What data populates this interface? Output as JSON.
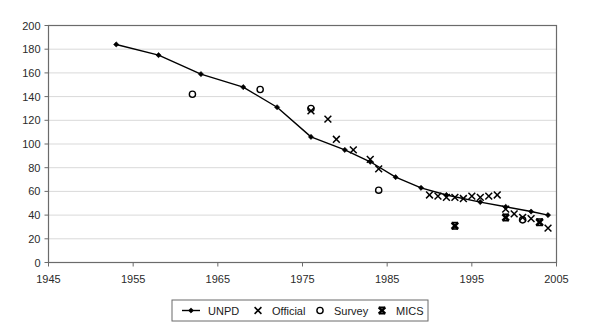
{
  "chart_data": {
    "type": "scatter",
    "title": "",
    "subtitle": "",
    "xlabel": "",
    "ylabel": "",
    "xlim": [
      1945,
      2005
    ],
    "ylim": [
      0,
      200
    ],
    "xticks": [
      1945,
      1955,
      1965,
      1975,
      1985,
      1995,
      2005
    ],
    "yticks": [
      0,
      20,
      40,
      60,
      80,
      100,
      120,
      140,
      160,
      180,
      200
    ],
    "grid": "horizontal",
    "legend_position": "bottom",
    "series": [
      {
        "name": "UNPD",
        "marker": "line-diamond",
        "type": "line",
        "points": [
          [
            1953,
            184
          ],
          [
            1958,
            175
          ],
          [
            1963,
            159
          ],
          [
            1968,
            148
          ],
          [
            1972,
            131
          ],
          [
            1976,
            106
          ],
          [
            1980,
            95
          ],
          [
            1983,
            85
          ],
          [
            1986,
            72
          ],
          [
            1989,
            63
          ],
          [
            1992,
            57
          ],
          [
            1996,
            51
          ],
          [
            1999,
            47
          ],
          [
            2002,
            43
          ],
          [
            2004,
            40
          ]
        ]
      },
      {
        "name": "Official",
        "marker": "x",
        "type": "scatter",
        "points": [
          [
            1976,
            128
          ],
          [
            1978,
            121
          ],
          [
            1979,
            104
          ],
          [
            1981,
            95
          ],
          [
            1983,
            87
          ],
          [
            1984,
            79
          ],
          [
            1990,
            57
          ],
          [
            1991,
            56
          ],
          [
            1992,
            55
          ],
          [
            1993,
            55
          ],
          [
            1994,
            54
          ],
          [
            1995,
            56
          ],
          [
            1996,
            55
          ],
          [
            1997,
            56
          ],
          [
            1998,
            57
          ],
          [
            1999,
            45
          ],
          [
            2000,
            41
          ],
          [
            2001,
            38
          ],
          [
            2002,
            37
          ],
          [
            2003,
            34
          ],
          [
            2004,
            29
          ]
        ]
      },
      {
        "name": "Survey",
        "marker": "circle",
        "type": "scatter",
        "points": [
          [
            1962,
            142
          ],
          [
            1970,
            146
          ],
          [
            1976,
            130
          ],
          [
            1984,
            61
          ],
          [
            2001,
            36
          ]
        ]
      },
      {
        "name": "MICS",
        "marker": "bold-x",
        "type": "scatter",
        "points": [
          [
            1993,
            31
          ],
          [
            1999,
            38
          ],
          [
            2003,
            34
          ]
        ]
      }
    ]
  },
  "legend": {
    "items": [
      {
        "label": "UNPD",
        "marker": "line-diamond"
      },
      {
        "label": "Official",
        "marker": "x"
      },
      {
        "label": "Survey",
        "marker": "circle"
      },
      {
        "label": "MICS",
        "marker": "bold-x"
      }
    ]
  },
  "colors": {
    "axis": "#6b6b6b",
    "grid": "#d9d9d9",
    "series": "#000000",
    "background": "#ffffff"
  }
}
